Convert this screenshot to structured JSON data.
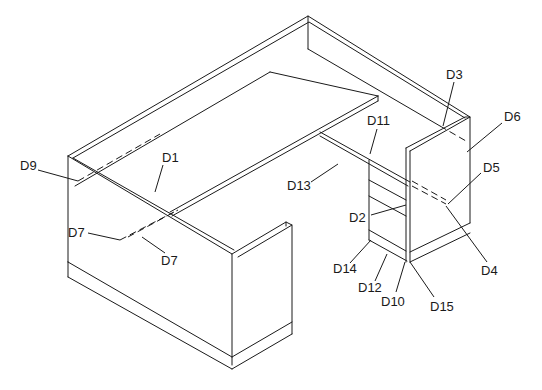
{
  "diagram": {
    "type": "isometric line drawing",
    "line_color": "#1a1a1a",
    "background": "#ffffff",
    "callouts": [
      {
        "id": "D1",
        "label": "D1",
        "x": 162,
        "y": 159
      },
      {
        "id": "D2",
        "label": "D2",
        "x": 349,
        "y": 222
      },
      {
        "id": "D3",
        "label": "D3",
        "x": 446,
        "y": 76
      },
      {
        "id": "D4",
        "label": "D4",
        "x": 481,
        "y": 275
      },
      {
        "id": "D5",
        "label": "D5",
        "x": 483,
        "y": 172
      },
      {
        "id": "D6",
        "label": "D6",
        "x": 504,
        "y": 121
      },
      {
        "id": "D7",
        "label": "D7",
        "x": 161,
        "y": 265
      },
      {
        "id": "D8",
        "label": "D8",
        "x": 70,
        "y": 237
      },
      {
        "id": "D9",
        "label": "D9",
        "x": 20,
        "y": 170
      },
      {
        "id": "D10",
        "label": "D10",
        "x": 382,
        "y": 306
      },
      {
        "id": "D11",
        "label": "D11",
        "x": 371,
        "y": 122
      },
      {
        "id": "D12",
        "label": "D12",
        "x": 360,
        "y": 292
      },
      {
        "id": "D13",
        "label": "D13",
        "x": 287,
        "y": 190
      },
      {
        "id": "D14",
        "label": "D14",
        "x": 336,
        "y": 273
      },
      {
        "id": "D15",
        "label": "D15",
        "x": 430,
        "y": 311
      }
    ]
  }
}
